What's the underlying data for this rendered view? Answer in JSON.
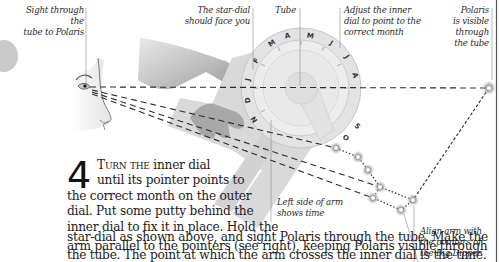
{
  "captions": {
    "sight": [
      "Sight through the",
      "tube to Polaris"
    ],
    "star_dial": [
      "The star-dial",
      "should face you"
    ],
    "tube": "Tube",
    "adjust": [
      "Adjust the inner",
      "dial to point to the",
      "correct month"
    ],
    "polaris": [
      "Polaris",
      "is visible",
      "through",
      "the tube"
    ],
    "left_side": [
      "Left side of arm",
      "shows time"
    ],
    "align": [
      "Align arm with",
      "the pointers of",
      "the Big Dipper"
    ]
  },
  "step": {
    "number": "4",
    "lead": "Turn the",
    "lines": [
      " inner dial",
      "until its pointer points to",
      "the correct month on the outer",
      "dial. Put some putty behind the",
      "inner dial to fix it in place. Hold the",
      "star-dial as shown above, and sight Polaris through the tube. Make the",
      "arm parallel to the pointers (see right), keeping Polaris visible through",
      "the tube. The point at which the arm crosses the inner dial is the time."
    ]
  },
  "dial": {
    "outer_labels": [
      "J",
      "F",
      "M",
      "A",
      "M",
      "J",
      "J",
      "A",
      "S",
      "O",
      "N",
      "D"
    ],
    "colors": {
      "plastic": "#d9d9d9",
      "dial_ring": "#e6e6e6",
      "star_glow": "#8c8c8c",
      "border": "#555555"
    }
  },
  "stars": {
    "polaris": {
      "x": 489,
      "y": 88
    },
    "big_dipper": [
      {
        "x": 336,
        "y": 148
      },
      {
        "x": 358,
        "y": 157
      },
      {
        "x": 368,
        "y": 170
      },
      {
        "x": 380,
        "y": 187
      },
      {
        "x": 373,
        "y": 198
      },
      {
        "x": 401,
        "y": 210
      },
      {
        "x": 413,
        "y": 200
      }
    ]
  }
}
